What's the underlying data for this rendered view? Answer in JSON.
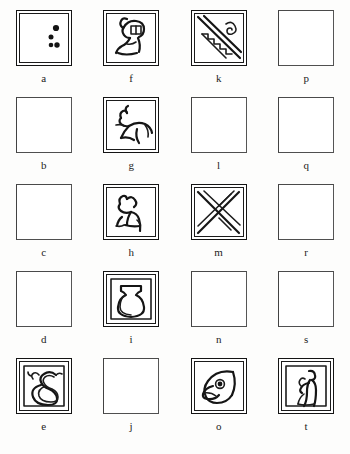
{
  "plate": {
    "background_color": "#fdfdfc",
    "ink_color": "#151515",
    "columns": 4,
    "rows": 5,
    "label_font_style": "serif-lowercase"
  },
  "cells": [
    {
      "label": "a",
      "state": "filled",
      "glyph": "dots-three-vertical-glyph",
      "description": "square frame with three filled dots at right"
    },
    {
      "label": "b",
      "state": "empty",
      "glyph": "empty-square",
      "description": "plain empty square"
    },
    {
      "label": "c",
      "state": "empty",
      "glyph": "empty-square",
      "description": "plain empty square"
    },
    {
      "label": "d",
      "state": "empty",
      "glyph": "empty-square",
      "description": "plain empty square"
    },
    {
      "label": "e",
      "state": "filled",
      "glyph": "coiled-snake-glyph",
      "description": "coiled serpent with head"
    },
    {
      "label": "f",
      "state": "filled",
      "glyph": "seated-figure-glyph",
      "description": "seated human figure with raised arm"
    },
    {
      "label": "g",
      "state": "filled",
      "glyph": "leaping-animal-glyph",
      "description": "leaping quadruped animal"
    },
    {
      "label": "h",
      "state": "filled",
      "glyph": "seated-dog-glyph",
      "description": "seated dog facing left"
    },
    {
      "label": "i",
      "state": "filled",
      "glyph": "vessel-jar-glyph",
      "description": "round-bodied jar or vessel"
    },
    {
      "label": "j",
      "state": "empty",
      "glyph": "empty-square",
      "description": "plain empty square"
    },
    {
      "label": "k",
      "state": "filled",
      "glyph": "stairway-spiral-glyph",
      "description": "diagonal band with stairs and spiral"
    },
    {
      "label": "l",
      "state": "empty",
      "glyph": "empty-square",
      "description": "plain empty square"
    },
    {
      "label": "m",
      "state": "filled",
      "glyph": "crossed-bands-glyph",
      "description": "crossed diagonal bands"
    },
    {
      "label": "n",
      "state": "empty",
      "glyph": "empty-square",
      "description": "plain empty square"
    },
    {
      "label": "o",
      "state": "filled",
      "glyph": "bird-head-glyph",
      "description": "bird head in profile with beak and eye"
    },
    {
      "label": "p",
      "state": "empty",
      "glyph": "empty-square",
      "description": "plain empty square"
    },
    {
      "label": "q",
      "state": "empty",
      "glyph": "empty-square",
      "description": "plain empty square"
    },
    {
      "label": "r",
      "state": "empty",
      "glyph": "empty-square",
      "description": "plain empty square"
    },
    {
      "label": "s",
      "state": "empty",
      "glyph": "empty-square",
      "description": "plain empty square"
    },
    {
      "label": "t",
      "state": "filled",
      "glyph": "standing-figure-glyph",
      "description": "standing human figure holding object"
    }
  ]
}
